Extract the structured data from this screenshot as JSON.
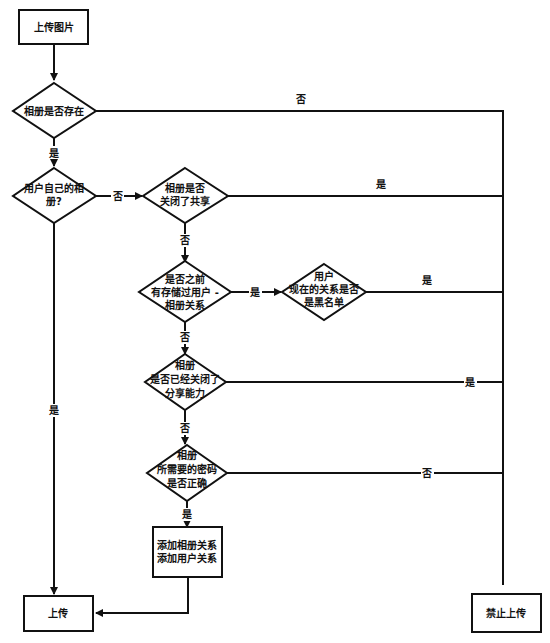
{
  "nodes": {
    "start": {
      "label": "上传图片"
    },
    "album_exists": {
      "label": "相册是否存在"
    },
    "own_album": {
      "lines": [
        "用户自己的相",
        "册?"
      ]
    },
    "sharing_closed": {
      "lines": [
        "相册是否",
        "关闭了共享"
      ]
    },
    "relation_stored": {
      "lines": [
        "是否之前",
        "有存储过用户 -",
        "相册关系"
      ]
    },
    "blacklist": {
      "lines": [
        "用户",
        "现在的关系是否",
        "是黑名单"
      ]
    },
    "sharing_ability_closed": {
      "lines": [
        "相册",
        "是否已经关闭了",
        "分享能力"
      ]
    },
    "password_correct": {
      "lines": [
        "相册",
        "所需要的密码",
        "是否正确"
      ]
    },
    "add_relations": {
      "lines": [
        "添加相册关系",
        "添加用户关系"
      ]
    },
    "upload": {
      "label": "上传"
    },
    "forbid_upload": {
      "label": "禁止上传"
    }
  },
  "edge_labels": {
    "album_exists_no": "否",
    "album_exists_yes": "是",
    "own_album_no": "否",
    "own_album_yes": "是",
    "sharing_closed_yes": "是",
    "sharing_closed_no": "否",
    "relation_stored_yes": "是",
    "relation_stored_no": "否",
    "blacklist_yes": "是",
    "sharing_ability_yes": "是",
    "sharing_ability_no": "否",
    "password_no": "否",
    "password_yes": "是"
  }
}
